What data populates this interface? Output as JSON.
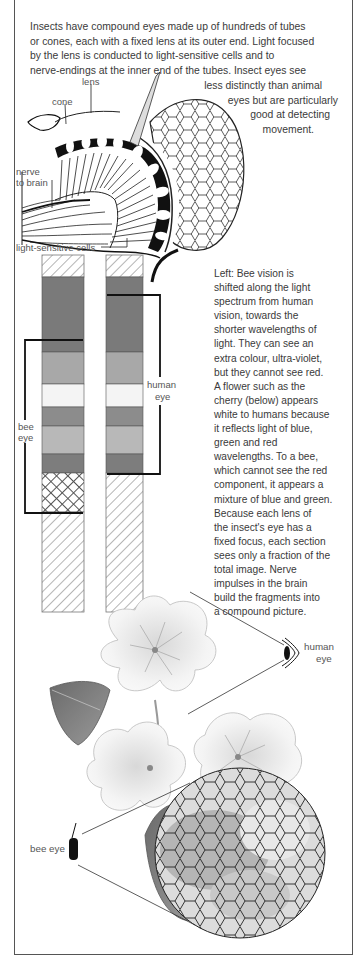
{
  "intro": {
    "lines": [
      "Insects have compound eyes made up of hundreds of tubes",
      "or cones, each with a fixed lens at its outer end. Light focused",
      "by the lens is conducted to light-sensitive cells and to",
      "nerve-endings at the inner end of the tubes. Insect eyes see"
    ],
    "continuation": [
      "less distinctly than animal",
      "eyes but are particularly",
      "good at detecting",
      "movement."
    ]
  },
  "eye_diagram": {
    "labels": {
      "lens": "lens",
      "cone": "cone",
      "nerve": "nerve",
      "to_brain": "to brain",
      "cells": "light-sensitive cells"
    }
  },
  "spectrum": {
    "bee_label_1": "bee",
    "bee_label_2": "eye",
    "human_label_1": "human",
    "human_label_2": "eye",
    "bands": [
      {
        "name": "infra-red-hatched",
        "color": "#ffffff"
      },
      {
        "name": "red",
        "color": "#7a7a7a"
      },
      {
        "name": "orange-yellow",
        "color": "#a8a8a8"
      },
      {
        "name": "white",
        "color": "#f4f4f4"
      },
      {
        "name": "green",
        "color": "#8c8c8c"
      },
      {
        "name": "blue",
        "color": "#b8b8b8"
      },
      {
        "name": "violet",
        "color": "#7d7d7d"
      },
      {
        "name": "ultra-violet",
        "color": "#ffffff"
      }
    ]
  },
  "caption": {
    "lines": [
      "Left: Bee vision is",
      "shifted along the light",
      "spectrum from human",
      "vision, towards the",
      "shorter wavelengths of",
      "light. They can see an",
      "extra colour, ultra-violet,",
      "but they cannot see red.",
      "A flower such as the",
      "cherry (below) appears",
      "white to humans because",
      "it reflects light of blue,",
      "green and red",
      "wavelengths. To a bee,",
      "which cannot see the red",
      "component, it appears a",
      "mixture of blue and green.",
      "Because each lens of",
      "the insect's eye has a",
      "fixed focus, each section",
      "sees only a fraction of the",
      "total image. Nerve",
      "impulses in the brain",
      "build the fragments into",
      "a compound picture."
    ]
  },
  "flower": {
    "human_eye_1": "human",
    "human_eye_2": "eye",
    "bee_eye": "bee eye"
  }
}
